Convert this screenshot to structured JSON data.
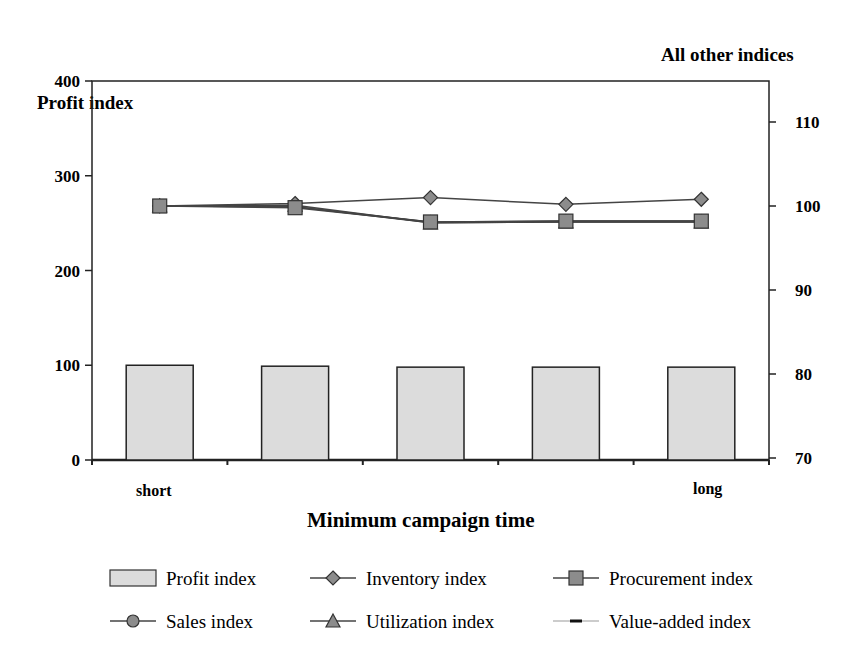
{
  "chart_data": {
    "type": "bar+line",
    "title": "",
    "xlabel": "Minimum campaign time",
    "ylabel_left": "Profit index",
    "ylabel_right": "All other indices",
    "categories": [
      "short",
      "",
      "",
      "",
      "long"
    ],
    "ylim_left": [
      0,
      400
    ],
    "yticks_left": [
      0,
      100,
      200,
      300,
      400
    ],
    "ylim_right": [
      70,
      114
    ],
    "yticks_right": [
      70,
      80,
      90,
      100,
      110
    ],
    "grid": false,
    "legend_position": "bottom",
    "series": [
      {
        "name": "Profit index",
        "type": "bar",
        "axis": "left",
        "values": [
          100,
          99,
          98,
          98,
          98
        ]
      },
      {
        "name": "Inventory index",
        "type": "line",
        "marker": "diamond",
        "axis": "right",
        "values": [
          100,
          100.3,
          101,
          100.2,
          100.8
        ]
      },
      {
        "name": "Procurement index",
        "type": "line",
        "marker": "square",
        "axis": "right",
        "values": [
          100,
          99.8,
          98.1,
          98.2,
          98.2
        ]
      },
      {
        "name": "Sales index",
        "type": "line",
        "marker": "circle",
        "axis": "right",
        "values": [
          100,
          99.9,
          98.1,
          98.2,
          98.2
        ]
      },
      {
        "name": "Utilization index",
        "type": "line",
        "marker": "triangle",
        "axis": "right",
        "values": [
          100,
          100.1,
          98.0,
          98.1,
          98.1
        ]
      },
      {
        "name": "Value-added index",
        "type": "line",
        "marker": "dash",
        "axis": "right",
        "values": [
          100,
          99.9,
          98.0,
          98.1,
          98.1
        ]
      }
    ]
  },
  "labels": {
    "left_axis_title": "Profit index",
    "right_axis_title": "All other indices",
    "x_axis_title": "Minimum campaign time",
    "cat_short": "short",
    "cat_long": "long"
  },
  "colors": {
    "bar_fill": "#dcdcdc",
    "marker_fill": "#8c8c8c",
    "line": "#444444",
    "axis": "#222222"
  }
}
